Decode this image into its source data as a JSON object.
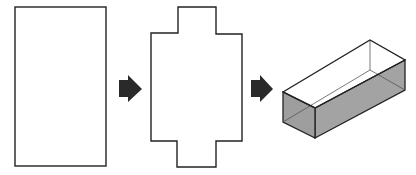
{
  "diagram": {
    "steps": [
      {
        "name": "flat-sheet",
        "shape": "rectangle"
      },
      {
        "name": "cut-net",
        "shape": "cross-shaped net"
      },
      {
        "name": "open-box",
        "shape": "3D open-top rectangular box"
      }
    ],
    "arrows": 2,
    "colors": {
      "stroke": "#222222",
      "arrow": "#2a2a2a",
      "box_side": "#a8a8a8",
      "box_side_dark": "#9a9a9a",
      "background": "#ffffff"
    }
  }
}
